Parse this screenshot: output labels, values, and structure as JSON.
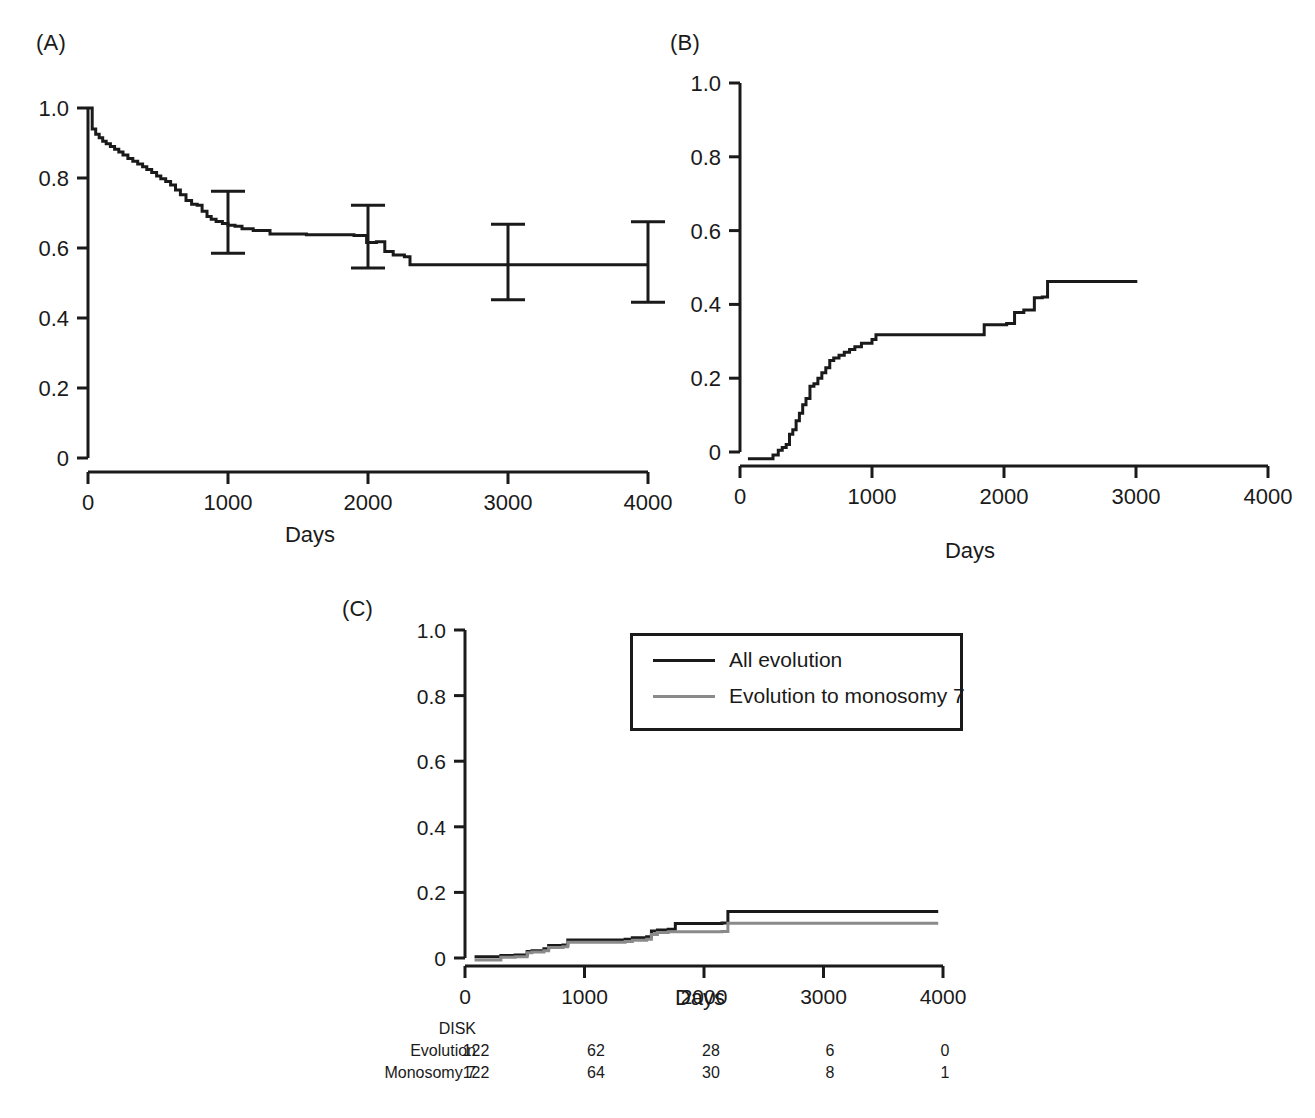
{
  "figure": {
    "panels": [
      {
        "id": "A",
        "label": "(A)",
        "xlabel": "Days",
        "ylabel": ""
      },
      {
        "id": "B",
        "label": "(B)",
        "xlabel": "Days",
        "ylabel": ""
      },
      {
        "id": "C",
        "label": "(C)",
        "xlabel": "Days",
        "ylabel": ""
      }
    ]
  },
  "legend": {
    "position": "inside-top-center",
    "entries": [
      {
        "label": "All evolution",
        "color": "#1a1a1a"
      },
      {
        "label": "Evolution to monosomy 7",
        "color": "#8a8a8a"
      }
    ]
  },
  "risk_table": {
    "title": "DISK",
    "row_labels": [
      "Evolution",
      "Monosomy 7"
    ],
    "time_points": [
      "0",
      "1000",
      "2000",
      "3000",
      "4000"
    ],
    "rows": [
      {
        "label": "Evolution",
        "counts": [
          "122",
          "62",
          "28",
          "6",
          "0"
        ]
      },
      {
        "label": "Monosomy 7",
        "counts": [
          "122",
          "64",
          "30",
          "8",
          "1"
        ]
      }
    ]
  },
  "chart_data": [
    {
      "type": "line",
      "id": "A",
      "title": "(A)",
      "xlabel": "Days",
      "ylabel": "",
      "xlim": [
        0,
        4000
      ],
      "ylim": [
        0,
        1.0
      ],
      "xticks": [
        0,
        1000,
        2000,
        3000,
        4000
      ],
      "xticklabels": [
        "0",
        "1000",
        "2000",
        "3000",
        "4000"
      ],
      "yticks": [
        0,
        0.2,
        0.4,
        0.6,
        0.8,
        1.0
      ],
      "yticklabels": [
        "0",
        "0.2",
        "0.4",
        "0.6",
        "0.8",
        "1.0"
      ],
      "grid": false,
      "step": "post",
      "series": [
        {
          "name": "Overall survival",
          "color": "#1a1a1a",
          "x": [
            0,
            30,
            55,
            80,
            105,
            130,
            160,
            190,
            220,
            250,
            285,
            320,
            355,
            390,
            420,
            455,
            490,
            520,
            555,
            590,
            625,
            660,
            700,
            740,
            780,
            815,
            850,
            880,
            915,
            960,
            1000,
            1050,
            1100,
            1180,
            1300,
            1560,
            1900,
            1990,
            2060,
            2120,
            2180,
            2260,
            2300,
            4000
          ],
          "y": [
            1.0,
            0.94,
            0.925,
            0.915,
            0.905,
            0.898,
            0.89,
            0.882,
            0.874,
            0.866,
            0.856,
            0.848,
            0.84,
            0.832,
            0.824,
            0.816,
            0.806,
            0.798,
            0.79,
            0.78,
            0.766,
            0.752,
            0.736,
            0.725,
            0.722,
            0.705,
            0.69,
            0.682,
            0.676,
            0.67,
            0.665,
            0.662,
            0.655,
            0.65,
            0.64,
            0.638,
            0.636,
            0.616,
            0.618,
            0.59,
            0.58,
            0.575,
            0.552,
            0.552
          ]
        }
      ],
      "error_bars": [
        {
          "x": 1000,
          "y": 0.665,
          "lower": 0.585,
          "upper": 0.762
        },
        {
          "x": 2000,
          "y": 0.617,
          "lower": 0.543,
          "upper": 0.722
        },
        {
          "x": 3000,
          "y": 0.552,
          "lower": 0.452,
          "upper": 0.668
        },
        {
          "x": 4000,
          "y": 0.552,
          "lower": 0.445,
          "upper": 0.675
        }
      ]
    },
    {
      "type": "line",
      "id": "B",
      "title": "(B)",
      "xlabel": "Days",
      "ylabel": "",
      "xlim": [
        0,
        4000
      ],
      "ylim": [
        0,
        1.0
      ],
      "xticks": [
        0,
        1000,
        2000,
        3000,
        4000
      ],
      "xticklabels": [
        "0",
        "1000",
        "2000",
        "3000",
        "4000"
      ],
      "yticks": [
        0,
        0.2,
        0.4,
        0.6,
        0.8,
        1.0
      ],
      "yticklabels": [
        "0",
        "0.2",
        "0.4",
        "0.6",
        "0.8",
        "1.0"
      ],
      "grid": false,
      "step": "post",
      "series": [
        {
          "name": "Cumulative incidence",
          "color": "#1a1a1a",
          "x": [
            60,
            200,
            250,
            290,
            320,
            350,
            375,
            400,
            425,
            450,
            475,
            500,
            530,
            560,
            590,
            620,
            650,
            680,
            710,
            750,
            790,
            830,
            870,
            920,
            1000,
            1030,
            1800,
            1850,
            2020,
            2080,
            2150,
            2230,
            2290,
            2330,
            3010
          ],
          "y": [
            -0.018,
            -0.018,
            -0.008,
            0.005,
            0.012,
            0.02,
            0.048,
            0.06,
            0.085,
            0.105,
            0.128,
            0.145,
            0.178,
            0.185,
            0.2,
            0.215,
            0.228,
            0.248,
            0.255,
            0.262,
            0.27,
            0.278,
            0.285,
            0.295,
            0.305,
            0.318,
            0.318,
            0.345,
            0.348,
            0.378,
            0.385,
            0.418,
            0.42,
            0.462,
            0.462
          ]
        }
      ],
      "error_bars": []
    },
    {
      "type": "line",
      "id": "C",
      "title": "(C)",
      "xlabel": "Days",
      "ylabel": "",
      "xlim": [
        0,
        4000
      ],
      "ylim": [
        0,
        1.0
      ],
      "xticks": [
        0,
        1000,
        2000,
        3000,
        4000
      ],
      "xticklabels": [
        "0",
        "1000",
        "2000",
        "3000",
        "4000"
      ],
      "yticks": [
        0,
        0.2,
        0.4,
        0.6,
        0.8,
        1.0
      ],
      "yticklabels": [
        "0",
        "0.2",
        "0.4",
        "0.6",
        "0.8",
        "1.0"
      ],
      "grid": false,
      "step": "post",
      "series": [
        {
          "name": "All evolution",
          "color": "#1a1a1a",
          "x": [
            80,
            250,
            300,
            420,
            520,
            560,
            660,
            700,
            820,
            860,
            1340,
            1400,
            1520,
            1560,
            1610,
            1700,
            1760,
            2150,
            2200,
            3960
          ],
          "y": [
            0.004,
            0.004,
            0.008,
            0.009,
            0.02,
            0.022,
            0.028,
            0.038,
            0.04,
            0.055,
            0.057,
            0.062,
            0.065,
            0.082,
            0.085,
            0.088,
            0.105,
            0.107,
            0.142,
            0.142
          ]
        },
        {
          "name": "Evolution to monosomy 7",
          "color": "#8a8a8a",
          "x": [
            80,
            250,
            300,
            420,
            520,
            560,
            660,
            700,
            820,
            860,
            1340,
            1400,
            1520,
            1560,
            1610,
            1700,
            1760,
            2150,
            2200,
            3960
          ],
          "y": [
            -0.006,
            -0.006,
            0.002,
            0.004,
            0.016,
            0.018,
            0.022,
            0.032,
            0.034,
            0.048,
            0.05,
            0.054,
            0.057,
            0.072,
            0.078,
            0.08,
            0.08,
            0.081,
            0.106,
            0.106
          ]
        }
      ],
      "error_bars": []
    }
  ]
}
